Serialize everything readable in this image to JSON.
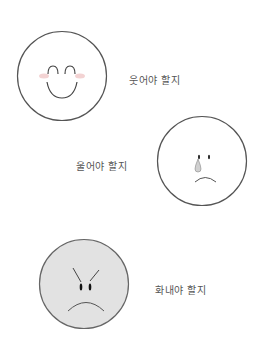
{
  "faces": [
    {
      "emotion": "happy",
      "caption": "웃어야 할지",
      "fill": "#ffffff",
      "stroke": "#555555",
      "blush": "#f2c4c4"
    },
    {
      "emotion": "sad",
      "caption": "울어야 할지",
      "fill": "#ffffff",
      "stroke": "#555555",
      "tear": "#cfcfcf"
    },
    {
      "emotion": "angry",
      "caption": "화내야 할지",
      "fill": "#e2e2e2",
      "stroke": "#666666"
    }
  ]
}
